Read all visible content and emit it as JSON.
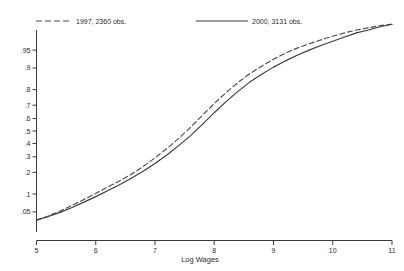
{
  "chart_data": {
    "type": "line",
    "title": "",
    "subtitle": "",
    "xlabel": "Log Wages",
    "ylabel": "",
    "xlim": [
      5,
      11
    ],
    "ylim": [
      0.02,
      0.98
    ],
    "y_scale": "probit",
    "grid": false,
    "legend_position": "top",
    "xticks": [
      "5",
      "6",
      "7",
      "8",
      "9",
      "10",
      "11"
    ],
    "xtick_values": [
      5,
      6,
      7,
      8,
      9,
      10,
      11
    ],
    "yticks": [
      ".05",
      ".1",
      ".2",
      ".3",
      ".4",
      ".5",
      ".6",
      ".7",
      ".8",
      ".9",
      ".95"
    ],
    "ytick_values": [
      0.05,
      0.1,
      0.2,
      0.3,
      0.4,
      0.5,
      0.6,
      0.7,
      0.8,
      0.9,
      0.95
    ],
    "series": [
      {
        "name": "1997, 2360 obs.",
        "style": "dashed",
        "color": "#4a4a4a",
        "x": [
          5.0,
          5.2,
          5.4,
          5.6,
          5.8,
          6.0,
          6.2,
          6.4,
          6.6,
          6.8,
          7.0,
          7.2,
          7.4,
          7.6,
          7.8,
          8.0,
          8.2,
          8.4,
          8.6,
          8.8,
          9.0,
          9.2,
          9.4,
          9.6,
          9.8,
          10.0,
          10.2,
          10.4,
          10.6,
          10.8,
          11.0
        ],
        "values": [
          0.035,
          0.042,
          0.052,
          0.065,
          0.082,
          0.102,
          0.127,
          0.155,
          0.19,
          0.235,
          0.292,
          0.36,
          0.44,
          0.53,
          0.625,
          0.712,
          0.783,
          0.838,
          0.878,
          0.906,
          0.928,
          0.943,
          0.954,
          0.962,
          0.968,
          0.973,
          0.977,
          0.98,
          0.982,
          0.984,
          0.985
        ]
      },
      {
        "name": "2000, 3131 obs.",
        "style": "solid",
        "color": "#3a3a3a",
        "x": [
          5.0,
          5.2,
          5.4,
          5.6,
          5.8,
          6.0,
          6.2,
          6.4,
          6.6,
          6.8,
          7.0,
          7.2,
          7.4,
          7.6,
          7.8,
          8.0,
          8.2,
          8.4,
          8.6,
          8.8,
          9.0,
          9.2,
          9.4,
          9.6,
          9.8,
          10.0,
          10.2,
          10.4,
          10.6,
          10.8,
          11.0
        ],
        "values": [
          0.035,
          0.041,
          0.049,
          0.06,
          0.074,
          0.091,
          0.112,
          0.137,
          0.168,
          0.206,
          0.254,
          0.313,
          0.383,
          0.463,
          0.553,
          0.645,
          0.725,
          0.79,
          0.84,
          0.876,
          0.903,
          0.923,
          0.938,
          0.95,
          0.959,
          0.966,
          0.972,
          0.977,
          0.98,
          0.983,
          0.985
        ]
      }
    ]
  },
  "legend": {
    "entries": [
      {
        "label": "1997, 2360 obs."
      },
      {
        "label": "2000, 3131 obs."
      }
    ]
  },
  "axes": {
    "x_title": "Log Wages"
  }
}
